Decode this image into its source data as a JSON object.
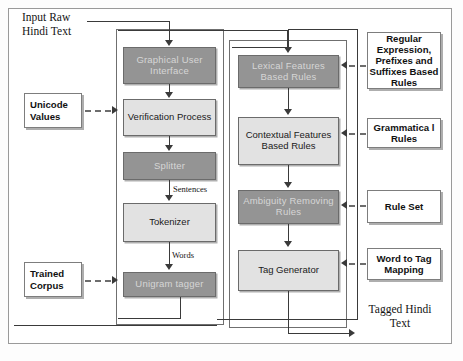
{
  "diagram": {
    "captions": {
      "input": "Input Raw\nHindi Text",
      "output": "Tagged Hindi\nText"
    },
    "edge_labels": {
      "sentences": "Sentences",
      "words": "Words"
    },
    "pipeline_left": [
      {
        "label": "Graphical User Interface",
        "style": "dark"
      },
      {
        "label": "Verification Process",
        "style": "light"
      },
      {
        "label": "Splitter",
        "style": "dark"
      },
      {
        "label": "Tokenizer",
        "style": "light"
      },
      {
        "label": "Unigram tagger",
        "style": "dark"
      }
    ],
    "pipeline_right": [
      {
        "label": "Lexical  Features Based  Rules",
        "style": "dark"
      },
      {
        "label": "Contextual Features Based Rules",
        "style": "light"
      },
      {
        "label": "Ambiguity Removing Rules",
        "style": "dark"
      },
      {
        "label": "Tag Generator",
        "style": "light"
      }
    ],
    "stores_left": [
      {
        "label": "Unicode Values"
      },
      {
        "label": "Trained Corpus"
      }
    ],
    "stores_right": [
      {
        "label": "Regular Expression, Prefixes and Suffixes Based Rules"
      },
      {
        "label": "Grammatica l Rules"
      },
      {
        "label": "Rule Set"
      },
      {
        "label": "Word to Tag Mapping"
      }
    ],
    "colors": {
      "dark_box": "#949494",
      "dark_box_text": "#d6d6d6",
      "light_box": "#e2e2e2",
      "light_box_text": "#1a1a1a",
      "store_box": "#ffffff",
      "frame": "#9a9a9a",
      "connector": "#3a3a3a"
    }
  }
}
